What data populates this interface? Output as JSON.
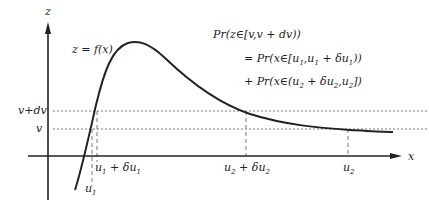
{
  "figure": {
    "axes": {
      "y_label": "z",
      "x_label": "x"
    },
    "curve_label": "z = f(x)",
    "levels": {
      "v_plus_dv": "v+dv",
      "v": "v"
    },
    "x_markers": {
      "u1": {
        "base": "u",
        "sub": "1"
      },
      "u1_plus_du1": {
        "base1": "u",
        "sub1": "1",
        "mid": " + δ",
        "base2": "u",
        "sub2": "1"
      },
      "u2_plus_du2": {
        "base1": "u",
        "sub1": "2",
        "mid": " + δ",
        "base2": "u",
        "sub2": "2"
      },
      "u2": {
        "base": "u",
        "sub": "2"
      }
    },
    "equation": {
      "line1": "Pr(z∈[v,v + dv))",
      "line2_prefix": "= Pr(x∈[u",
      "line2_s1": "1",
      "line2_mid": ",u",
      "line2_s2": "1",
      "line2_mid2": " + δu",
      "line2_s3": "1",
      "line2_end": "))",
      "line3_prefix": "+ Pr(x∈(u",
      "line3_s1": "2",
      "line3_mid": " + δu",
      "line3_s2": "2",
      "line3_mid2": ",u",
      "line3_s3": "2",
      "line3_end": "])"
    },
    "colors": {
      "ink": "#222222",
      "dash": "#555555",
      "background": "#ffffff"
    }
  }
}
